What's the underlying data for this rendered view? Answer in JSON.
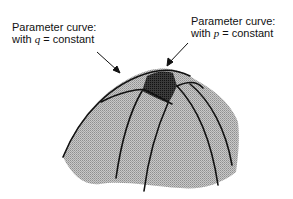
{
  "labels": {
    "q_curve": {
      "line1": "Parameter curve:",
      "prefix": "with ",
      "variable": "q",
      "suffix": " = constant"
    },
    "p_curve": {
      "line1": "Parameter curve:",
      "prefix": "with ",
      "variable": "p",
      "suffix": " = constant"
    }
  },
  "colors": {
    "surface_fill": "#b8b8b8",
    "patch_fill": "#333333",
    "curve_stroke": "#111111"
  }
}
